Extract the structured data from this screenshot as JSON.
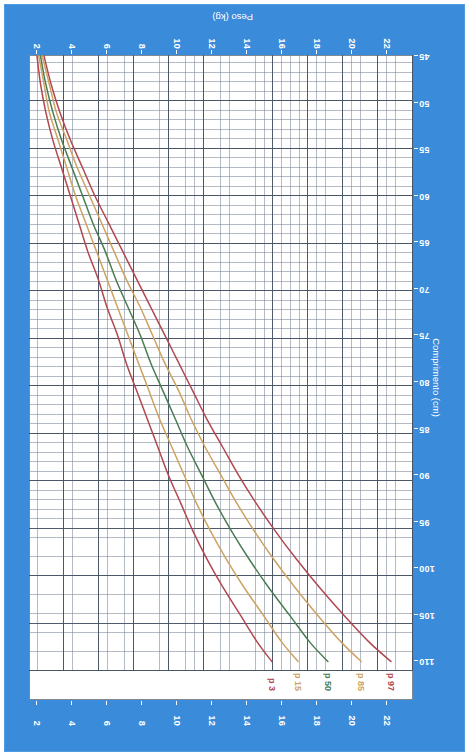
{
  "page": {
    "background_color": "#3a8bda",
    "card_color": "#3a8bda",
    "plot_background": "#ffffff"
  },
  "chart_data": {
    "type": "line",
    "title": "",
    "subtitle": "",
    "orientation": "rotated-180",
    "xlabel": "Peso (kg)",
    "ylabel": "Comprimento (cm)",
    "xlim": [
      2,
      23
    ],
    "ylim": [
      45,
      112
    ],
    "xticks": [
      22,
      20,
      18,
      16,
      14,
      12,
      10,
      8,
      6,
      4,
      2
    ],
    "yticks": [
      110,
      105,
      100,
      95,
      90,
      85,
      80,
      75,
      70,
      65,
      60,
      55,
      50,
      45
    ],
    "xtick_labels": [
      "22",
      "20",
      "18",
      "16",
      "14",
      "12",
      "10",
      "8",
      "6",
      "4",
      "2"
    ],
    "ytick_labels": [
      "110",
      "105",
      "100",
      "95",
      "90",
      "85",
      "80",
      "75",
      "70",
      "65",
      "60",
      "55",
      "50",
      "45"
    ],
    "grid": true,
    "grid_minor_x_step": 0.5,
    "grid_minor_y_step": 1,
    "grid_major_x_step": 2,
    "grid_major_y_step": 5,
    "legend": "inline-curve-labels",
    "x_unit": "kg",
    "y_unit": "cm",
    "series": [
      {
        "name": "p 97",
        "label": "p 97",
        "color": "#b1474f",
        "points": [
          [
            2.4,
            45
          ],
          [
            2.8,
            48
          ],
          [
            3.3,
            51
          ],
          [
            3.9,
            54
          ],
          [
            4.6,
            57
          ],
          [
            5.3,
            60
          ],
          [
            6.1,
            63
          ],
          [
            6.9,
            66
          ],
          [
            7.7,
            69
          ],
          [
            8.5,
            72
          ],
          [
            9.3,
            75
          ],
          [
            10.1,
            78
          ],
          [
            10.9,
            81
          ],
          [
            11.7,
            84
          ],
          [
            12.6,
            87
          ],
          [
            13.5,
            90
          ],
          [
            14.5,
            93
          ],
          [
            15.6,
            96
          ],
          [
            16.8,
            99
          ],
          [
            18.1,
            102
          ],
          [
            19.5,
            105
          ],
          [
            21.0,
            108
          ],
          [
            22.2,
            110
          ]
        ]
      },
      {
        "name": "p 85",
        "label": "p 85",
        "color": "#cda262",
        "points": [
          [
            2.3,
            45
          ],
          [
            2.7,
            48
          ],
          [
            3.1,
            51
          ],
          [
            3.7,
            54
          ],
          [
            4.3,
            57
          ],
          [
            5.0,
            60
          ],
          [
            5.7,
            63
          ],
          [
            6.4,
            66
          ],
          [
            7.1,
            69
          ],
          [
            7.9,
            72
          ],
          [
            8.6,
            75
          ],
          [
            9.3,
            78
          ],
          [
            10.1,
            81
          ],
          [
            10.8,
            84
          ],
          [
            11.6,
            87
          ],
          [
            12.5,
            90
          ],
          [
            13.4,
            93
          ],
          [
            14.4,
            96
          ],
          [
            15.5,
            99
          ],
          [
            16.7,
            102
          ],
          [
            18.0,
            105
          ],
          [
            19.4,
            108
          ],
          [
            20.5,
            110
          ]
        ]
      },
      {
        "name": "p 50",
        "label": "p 50",
        "color": "#4a7c52",
        "points": [
          [
            2.2,
            45
          ],
          [
            2.5,
            48
          ],
          [
            2.9,
            51
          ],
          [
            3.4,
            54
          ],
          [
            4.0,
            57
          ],
          [
            4.6,
            60
          ],
          [
            5.2,
            63
          ],
          [
            5.9,
            66
          ],
          [
            6.5,
            69
          ],
          [
            7.2,
            72
          ],
          [
            7.9,
            75
          ],
          [
            8.5,
            78
          ],
          [
            9.2,
            81
          ],
          [
            9.9,
            84
          ],
          [
            10.6,
            87
          ],
          [
            11.4,
            90
          ],
          [
            12.2,
            93
          ],
          [
            13.1,
            96
          ],
          [
            14.1,
            99
          ],
          [
            15.2,
            102
          ],
          [
            16.4,
            105
          ],
          [
            17.6,
            108
          ],
          [
            18.6,
            110
          ]
        ]
      },
      {
        "name": "p 15",
        "label": "p 15",
        "color": "#cda262",
        "points": [
          [
            2.1,
            45
          ],
          [
            2.4,
            48
          ],
          [
            2.7,
            51
          ],
          [
            3.2,
            54
          ],
          [
            3.7,
            57
          ],
          [
            4.2,
            60
          ],
          [
            4.8,
            63
          ],
          [
            5.4,
            66
          ],
          [
            6.0,
            69
          ],
          [
            6.6,
            72
          ],
          [
            7.2,
            75
          ],
          [
            7.8,
            78
          ],
          [
            8.4,
            81
          ],
          [
            9.0,
            84
          ],
          [
            9.7,
            87
          ],
          [
            10.4,
            90
          ],
          [
            11.1,
            93
          ],
          [
            11.9,
            96
          ],
          [
            12.8,
            99
          ],
          [
            13.8,
            102
          ],
          [
            14.9,
            105
          ],
          [
            16.0,
            108
          ],
          [
            16.9,
            110
          ]
        ]
      },
      {
        "name": "p 3",
        "label": "p 3",
        "color": "#b1474f",
        "points": [
          [
            2.0,
            45
          ],
          [
            2.2,
            48
          ],
          [
            2.5,
            51
          ],
          [
            2.9,
            54
          ],
          [
            3.4,
            57
          ],
          [
            3.9,
            60
          ],
          [
            4.4,
            63
          ],
          [
            4.9,
            66
          ],
          [
            5.5,
            69
          ],
          [
            6.0,
            72
          ],
          [
            6.6,
            75
          ],
          [
            7.1,
            78
          ],
          [
            7.7,
            81
          ],
          [
            8.3,
            84
          ],
          [
            8.9,
            87
          ],
          [
            9.5,
            90
          ],
          [
            10.2,
            93
          ],
          [
            10.9,
            96
          ],
          [
            11.7,
            99
          ],
          [
            12.6,
            102
          ],
          [
            13.6,
            105
          ],
          [
            14.6,
            108
          ],
          [
            15.4,
            110
          ]
        ]
      }
    ]
  },
  "axes": {
    "x_title": "Peso (kg)",
    "y_title": "Comprimento (cm)"
  }
}
